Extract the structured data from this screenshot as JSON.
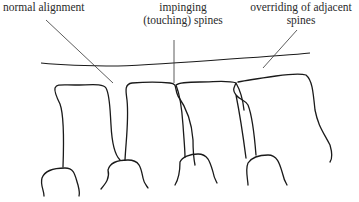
{
  "diagram": {
    "type": "anatomical line drawing",
    "labels": [
      {
        "id": "normal",
        "text": "normal alignment"
      },
      {
        "id": "impinging",
        "line1": "impinging",
        "line2": "(touching) spines"
      },
      {
        "id": "overriding",
        "line1": "overriding of adjacent",
        "line2": "spines"
      }
    ],
    "colors": {
      "line": "#1a1a1a",
      "background": "#ffffff"
    }
  }
}
